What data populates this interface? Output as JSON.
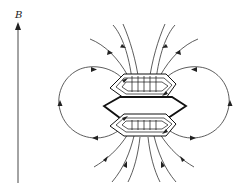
{
  "figure": {
    "axis": {
      "label": "B",
      "direction": "up"
    },
    "elements": {
      "upper_coil": "hexagonal coil (upper)",
      "middle_plate": "hexagonal plate",
      "lower_coil": "hexagonal coil (lower)"
    },
    "field_lines": {
      "top": {
        "count": 6,
        "direction": "inward-downward"
      },
      "bottom": {
        "count": 6,
        "direction": "outward-downward"
      },
      "left_loop": {
        "arrows": [
          "right (top)",
          "up (left side)",
          "left (bottom)"
        ]
      },
      "right_loop": {
        "arrows": [
          "left (top)",
          "up (right side)",
          "right (bottom)"
        ]
      }
    },
    "colors": {
      "stroke": "#222222",
      "background": "#ffffff"
    }
  }
}
